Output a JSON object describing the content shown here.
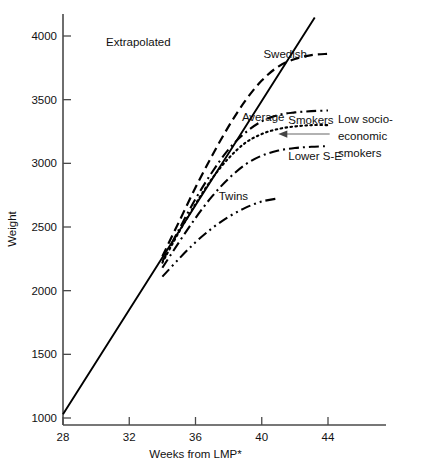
{
  "chart_data": {
    "type": "line",
    "title": "",
    "xlabel": "Weeks from LMP*",
    "ylabel": "Weight",
    "xlim": [
      27.2,
      47.5
    ],
    "ylim": [
      950,
      4250
    ],
    "xticks": [
      28,
      32,
      36,
      40,
      44
    ],
    "yticks": [
      1000,
      1500,
      2000,
      2500,
      3000,
      3500,
      4000
    ],
    "grid": false,
    "legend_position": "inline-annotations",
    "series": [
      {
        "name": "Extrapolated",
        "style": "solid",
        "x": [
          28,
          30,
          32,
          34,
          36,
          38,
          40,
          42,
          43.2
        ],
        "values": [
          1030,
          1440,
          1850,
          2260,
          2670,
          3080,
          3490,
          3900,
          4145
        ]
      },
      {
        "name": "Swedish",
        "style": "dashed",
        "x": [
          34,
          35,
          36,
          37,
          38,
          39,
          40,
          41,
          42,
          43,
          44
        ],
        "values": [
          2270,
          2540,
          2810,
          3060,
          3290,
          3490,
          3650,
          3760,
          3820,
          3850,
          3860
        ]
      },
      {
        "name": "Average",
        "style": "dotted",
        "x": [
          34,
          35,
          36,
          37,
          38,
          39,
          40,
          41,
          42,
          43,
          44
        ],
        "values": [
          2220,
          2460,
          2680,
          2880,
          3040,
          3160,
          3230,
          3270,
          3290,
          3300,
          3300
        ]
      },
      {
        "name": "Smokers",
        "style": "dash-dot",
        "x": [
          34,
          35,
          36,
          37,
          38,
          39,
          40,
          41,
          42,
          43,
          44
        ],
        "values": [
          2230,
          2480,
          2720,
          2930,
          3110,
          3240,
          3330,
          3380,
          3400,
          3410,
          3415
        ]
      },
      {
        "name": "Lower S-E",
        "style": "dash-dot",
        "x": [
          34,
          35,
          36,
          37,
          38,
          39,
          40,
          41,
          42,
          43,
          44
        ],
        "values": [
          2180,
          2380,
          2570,
          2740,
          2880,
          2990,
          3060,
          3100,
          3120,
          3130,
          3135
        ]
      },
      {
        "name": "Twins",
        "style": "dash-dot-dot",
        "x": [
          34,
          35,
          36,
          37,
          38,
          39,
          40,
          41
        ],
        "values": [
          2110,
          2250,
          2380,
          2490,
          2580,
          2650,
          2700,
          2725
        ]
      }
    ],
    "annotations": [
      {
        "name": "extrapolated-label",
        "text": "Extrapolated",
        "x": 30.6,
        "y": 3950
      },
      {
        "name": "swedish-label",
        "text": "Swedish",
        "x": 40.1,
        "y": 3855
      },
      {
        "name": "average-label",
        "text": "Average",
        "x": 38.8,
        "y": 3360
      },
      {
        "name": "smokers-label",
        "text": "Smokers",
        "x": 41.6,
        "y": 3340
      },
      {
        "name": "lower-se-label",
        "text": "Lower S-E",
        "x": 41.6,
        "y": 3060
      },
      {
        "name": "twins-label",
        "text": "Twins",
        "x": 37.4,
        "y": 2745
      },
      {
        "name": "low-socio-economic-smokers-label-line1",
        "text": "Low socio-",
        "x": 44.6,
        "y": 3345
      },
      {
        "name": "low-socio-economic-smokers-label-line2",
        "text": "economic",
        "x": 44.6,
        "y": 3215
      },
      {
        "name": "low-socio-economic-smokers-label-line3",
        "text": "smokers",
        "x": 44.6,
        "y": 3085
      }
    ],
    "tick_labels": {
      "x": [
        "28",
        "32",
        "36",
        "40",
        "44"
      ],
      "y": [
        "1000",
        "1500",
        "2000",
        "2500",
        "3000",
        "3500",
        "4000"
      ]
    }
  },
  "colors": {
    "line": "#000000",
    "axis": "#4a4a4a",
    "text": "#111111",
    "arrow": "#666666",
    "background": "#ffffff"
  }
}
